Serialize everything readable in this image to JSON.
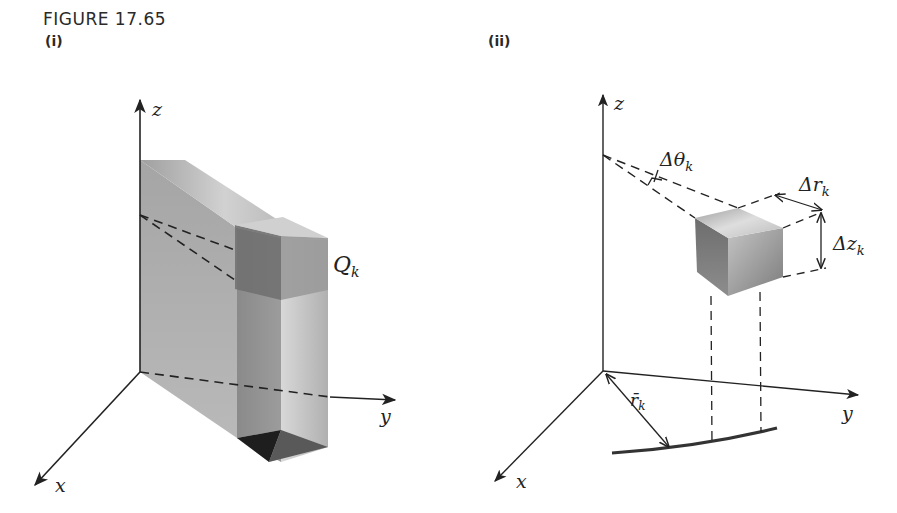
{
  "figure": {
    "title": "FIGURE 17.65",
    "panels": [
      {
        "label": "(i)",
        "axes": {
          "x": "x",
          "y": "y",
          "z": "z"
        },
        "region_label": "Q",
        "region_subscript": "k"
      },
      {
        "label": "(ii)",
        "axes": {
          "x": "x",
          "y": "y",
          "z": "z"
        },
        "annotations": {
          "delta_theta": {
            "prefix": "Δθ",
            "sub": "k"
          },
          "delta_r": {
            "prefix": "Δr",
            "sub": "k"
          },
          "delta_z": {
            "prefix": "Δz",
            "sub": "k"
          },
          "r_bar": {
            "prefix": "r̄",
            "sub": "k"
          }
        }
      }
    ]
  },
  "colors": {
    "ink": "#222222",
    "solid_light": "#c9c9c9",
    "solid_mid": "#a8a8a8",
    "solid_dark": "#7d7d7d",
    "base_dark": "#1e1e1e"
  }
}
